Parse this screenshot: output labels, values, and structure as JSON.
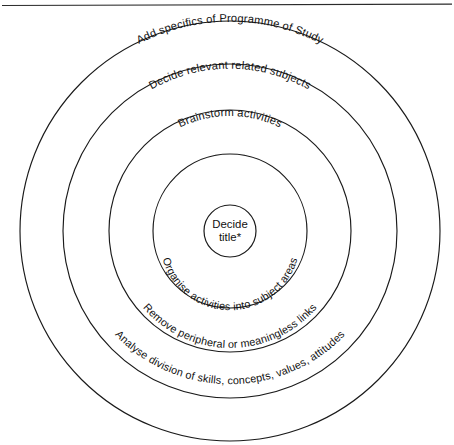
{
  "page": {
    "background_color": "#ffffff",
    "ink_color": "#1a1a1a",
    "width": 454,
    "height": 445
  },
  "top_rule": {
    "name": "horizontal-rule",
    "color": "#2b2b2b"
  },
  "diagram": {
    "type": "concentric-circles",
    "center": {
      "x": 230,
      "y": 231
    },
    "rings": [
      {
        "index": 1,
        "radius": 210,
        "label": "Add specifics of Programme of Study",
        "position": "top"
      },
      {
        "index": 2,
        "radius": 167,
        "label": "Decide relevant related subjects",
        "position": "top"
      },
      {
        "index": 3,
        "radius": 121,
        "label": "Brainstorm activities",
        "position": "top"
      },
      {
        "index": 4,
        "radius": 77,
        "label": "",
        "position": "none"
      },
      {
        "index": 5,
        "radius": 26,
        "label": "Decide title*",
        "position": "center"
      }
    ],
    "bottom_labels": [
      {
        "index": 1,
        "radius": 77,
        "label": "Organise activities into subject areas"
      },
      {
        "index": 2,
        "radius": 121,
        "label": "Remove peripheral or meaningless links"
      },
      {
        "index": 3,
        "radius": 167,
        "label": "Analyse division of skills, concepts, values, attitudes"
      }
    ],
    "center_text": {
      "line1": "Decide",
      "line2": "title*"
    }
  }
}
